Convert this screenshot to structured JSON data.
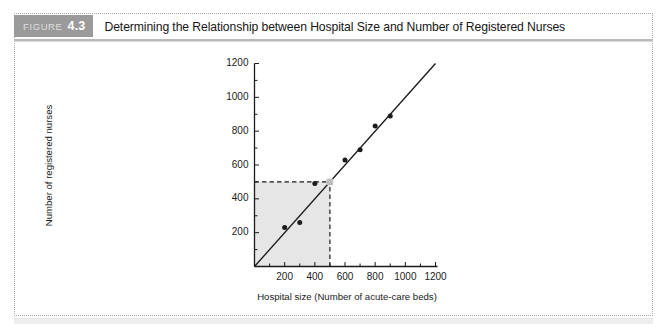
{
  "figure": {
    "badge_word": "FIGURE",
    "badge_number": "4.3",
    "caption": "Determining the Relationship between Hospital Size and Number of Registered Nurses",
    "badge_color": "#9a9a9a",
    "rule_color": "#b9b9b9"
  },
  "chart_data": {
    "type": "scatter",
    "title": "Determining the Relationship between Hospital Size and Number of Registered Nurses",
    "xlabel": "Hospital size (Number of acute-care beds)",
    "ylabel": "Number of registered nurses",
    "xlim": [
      0,
      1200
    ],
    "ylim": [
      0,
      1200
    ],
    "xticks": [
      200,
      400,
      600,
      800,
      1000,
      1200
    ],
    "yticks": [
      200,
      400,
      600,
      800,
      1000,
      1200
    ],
    "xtick_labels": [
      "200",
      "400",
      "600",
      "800",
      "1000",
      "1200"
    ],
    "ytick_labels": [
      "200",
      "400",
      "600",
      "800",
      "1000",
      "1200"
    ],
    "minor_tick_step": 100,
    "grid": false,
    "legend": null,
    "series": [
      {
        "name": "Observed hospitals",
        "marker": "filled-circle",
        "color": "#1b1b1b",
        "x": [
          200,
          300,
          400,
          600,
          700,
          800,
          900
        ],
        "y": [
          230,
          260,
          490,
          630,
          690,
          830,
          890
        ]
      },
      {
        "name": "Predicted value",
        "marker": "filled-square",
        "color": "#bdbdbd",
        "x": [
          500
        ],
        "y": [
          500
        ]
      }
    ],
    "trendline": {
      "name": "Regression line",
      "color": "#1b1b1b",
      "from": [
        0,
        0
      ],
      "to": [
        1200,
        1200
      ]
    },
    "annotations": [
      {
        "type": "shaded-rect",
        "name": "prediction-shaded-region",
        "x0": 0,
        "y0": 0,
        "x1": 500,
        "y1": 500,
        "fill": "#e6e6e6"
      },
      {
        "type": "dashed-line",
        "name": "horizontal-projection",
        "from": [
          0,
          500
        ],
        "to": [
          500,
          500
        ],
        "color": "#1b1b1b"
      },
      {
        "type": "dashed-line",
        "name": "vertical-projection",
        "from": [
          500,
          0
        ],
        "to": [
          500,
          500
        ],
        "color": "#1b1b1b"
      }
    ]
  }
}
